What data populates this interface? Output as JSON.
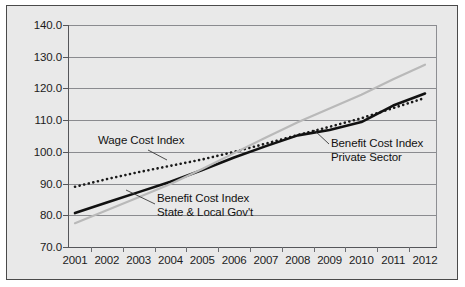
{
  "chart_data": {
    "type": "line",
    "title": "",
    "xlabel": "",
    "ylabel": "",
    "ylim": [
      70.0,
      140.0
    ],
    "ytick_labels": [
      "140.0",
      "130.0",
      "120.0",
      "110.0",
      "100.0",
      "90.0",
      "80.0",
      "70.0"
    ],
    "ytick_values": [
      140.0,
      130.0,
      120.0,
      110.0,
      100.0,
      90.0,
      80.0,
      70.0
    ],
    "grid": true,
    "legend_position": "inline-annotations",
    "categories": [
      "2001",
      "2002",
      "2003",
      "2004",
      "2005",
      "2006",
      "2007",
      "2008",
      "2009",
      "2010",
      "2011",
      "2012"
    ],
    "x": [
      2001,
      2002,
      2003,
      2004,
      2005,
      2006,
      2007,
      2008,
      2009,
      2010,
      2011,
      2012
    ],
    "series": [
      {
        "name": "Wage Cost Index",
        "style": "dotted",
        "color": "#1a1a1a",
        "values": [
          89.0,
          91.4,
          93.6,
          95.6,
          97.6,
          100.0,
          102.6,
          105.3,
          107.9,
          110.6,
          113.8,
          117.0
        ]
      },
      {
        "name": "Benefit Cost Index Private Sector",
        "style": "solid",
        "color": "#111111",
        "values": [
          80.7,
          84.0,
          87.3,
          90.6,
          94.3,
          98.2,
          101.8,
          105.2,
          106.9,
          109.4,
          114.6,
          118.4
        ]
      },
      {
        "name": "Benefit Cost Index State & Local Gov't",
        "style": "solid-light",
        "color": "#b9b9b9",
        "values": [
          77.5,
          81.6,
          85.7,
          89.9,
          94.6,
          99.6,
          104.5,
          109.3,
          113.7,
          118.0,
          122.9,
          127.5
        ]
      }
    ],
    "annotations": [
      {
        "id": "wage-cost-index",
        "lines": [
          "Wage Cost Index"
        ],
        "text_x": 98,
        "text_y": 134,
        "leader": "M 148,150 L 167,160"
      },
      {
        "id": "benefit-cost-index-state-local",
        "lines": [
          "Benefit Cost Index",
          "State & Local Gov't"
        ],
        "text_x": 157,
        "text_y": 192,
        "leader": "M 155,204 L 126,190"
      },
      {
        "id": "benefit-cost-index-private-sector",
        "lines": [
          "Benefit Cost Index",
          "Private Sector"
        ],
        "text_x": 331,
        "text_y": 137,
        "leader": "M 329,144 L 314,130"
      }
    ]
  },
  "colors": {
    "figure_background": "#ffffff",
    "panel_background": "#e9e9e9",
    "frame": "#4a4a4a",
    "axis": "#55565a",
    "grid": "#8a8b8f",
    "text": "#1c1c1c",
    "series_dotted": "#1a1a1a",
    "series_solid_dark": "#111111",
    "series_solid_light": "#b9b9b9"
  }
}
